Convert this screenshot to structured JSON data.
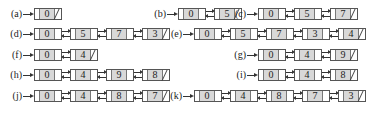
{
  "lists": [
    {
      "label": "(a)",
      "keys": [
        "0"
      ]
    },
    {
      "label": "(b)",
      "keys": [
        "0",
        "5"
      ]
    },
    {
      "label": "(c)",
      "keys": [
        "0",
        "5",
        "7"
      ]
    },
    {
      "label": "(d)",
      "keys": [
        "0",
        "5",
        "7",
        "3"
      ]
    },
    {
      "label": "(e)",
      "keys": [
        "0",
        "5",
        "7",
        "3",
        "4"
      ]
    },
    {
      "label": "(f)",
      "keys": [
        "0",
        "4"
      ]
    },
    {
      "label": "(g)",
      "keys": [
        "0",
        "4",
        "9"
      ]
    },
    {
      "label": "(h)",
      "keys": [
        "0",
        "4",
        "9",
        "8"
      ]
    },
    {
      "label": "(i)",
      "keys": [
        "0",
        "4",
        "8"
      ]
    },
    {
      "label": "(j)",
      "keys": [
        "0",
        "4",
        "8",
        "7"
      ]
    },
    {
      "label": "(k)",
      "keys": [
        "0",
        "4",
        "8",
        "7",
        "3"
      ]
    }
  ],
  "colors": {
    "key_fill": "#d8d8d8",
    "stroke": "#333333"
  }
}
